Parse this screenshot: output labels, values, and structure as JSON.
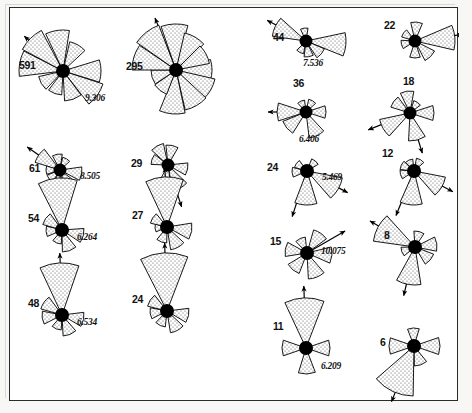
{
  "figure": {
    "title": "",
    "background": "#ffffff",
    "frame_color": "#2b2b2b",
    "petal_fill": "#ffffff",
    "petal_stipple": "#555555",
    "hub_color": "#000000"
  },
  "chart_data": {
    "type": "rose",
    "title": "",
    "xlabel": "",
    "ylabel": "",
    "note": "Sixteen circular (rose) diagrams of directional data; each shows petals radiating from a filled hub, a sample-count label, an optional mean vector magnitude value, and mean-direction arrows.",
    "columns": 4,
    "rows": 4,
    "roses": [
      {
        "id": "rose-591",
        "count": "591",
        "value": "9.306",
        "col": 1,
        "row": 1,
        "cx": 53,
        "cy": 63,
        "hub": 7.0,
        "petals": [
          {
            "mid": 0,
            "half": 17,
            "r": 38
          },
          {
            "mid": 35,
            "half": 17,
            "r": 42
          },
          {
            "mid": 70,
            "half": 17,
            "r": 30
          },
          {
            "mid": 110,
            "half": 17,
            "r": 24
          },
          {
            "mid": 150,
            "half": 17,
            "r": 25
          },
          {
            "mid": 190,
            "half": 17,
            "r": 44
          },
          {
            "mid": 225,
            "half": 17,
            "r": 46
          },
          {
            "mid": 262,
            "half": 17,
            "r": 41
          },
          {
            "mid": 300,
            "half": 17,
            "r": 30
          }
        ],
        "arrows": [
          {
            "dir": 222,
            "len": 52
          }
        ]
      },
      {
        "id": "rose-295",
        "count": "295",
        "value": "",
        "col": 2,
        "row": 1,
        "cx": 166,
        "cy": 62,
        "hub": 7.0,
        "petals": [
          {
            "mid": 0,
            "half": 17,
            "r": 36
          },
          {
            "mid": 30,
            "half": 17,
            "r": 40
          },
          {
            "mid": 60,
            "half": 17,
            "r": 41
          },
          {
            "mid": 95,
            "half": 17,
            "r": 44
          },
          {
            "mid": 128,
            "half": 17,
            "r": 26
          },
          {
            "mid": 163,
            "half": 17,
            "r": 25
          },
          {
            "mid": 197,
            "half": 17,
            "r": 44
          },
          {
            "mid": 232,
            "half": 17,
            "r": 48
          },
          {
            "mid": 268,
            "half": 17,
            "r": 46
          },
          {
            "mid": 300,
            "half": 17,
            "r": 38
          },
          {
            "mid": 332,
            "half": 17,
            "r": 34
          }
        ],
        "arrows": [
          {
            "dir": 248,
            "len": 56
          }
        ]
      },
      {
        "id": "rose-44",
        "count": "44",
        "value": "7.536",
        "col": 3,
        "row": 1,
        "cx": 296,
        "cy": 33,
        "hub": 6.5,
        "petals": [
          {
            "mid": 5,
            "half": 17,
            "r": 40
          },
          {
            "mid": 40,
            "half": 17,
            "r": 20
          },
          {
            "mid": 80,
            "half": 17,
            "r": 16
          },
          {
            "mid": 118,
            "half": 17,
            "r": 13
          },
          {
            "mid": 205,
            "half": 17,
            "r": 34
          },
          {
            "mid": 262,
            "half": 17,
            "r": 13
          }
        ],
        "arrows": [
          {
            "dir": 208,
            "len": 44
          }
        ]
      },
      {
        "id": "rose-22",
        "count": "22",
        "value": "",
        "col": 4,
        "row": 1,
        "cx": 405,
        "cy": 33,
        "hub": 6.5,
        "petals": [
          {
            "mid": 355,
            "half": 18,
            "r": 40
          },
          {
            "mid": 45,
            "half": 18,
            "r": 22
          },
          {
            "mid": 90,
            "half": 18,
            "r": 17
          },
          {
            "mid": 165,
            "half": 18,
            "r": 14
          },
          {
            "mid": 215,
            "half": 18,
            "r": 14
          },
          {
            "mid": 275,
            "half": 18,
            "r": 19
          }
        ],
        "arrows": [
          {
            "dir": 352,
            "len": 48
          }
        ]
      },
      {
        "id": "rose-61",
        "count": "61",
        "value": "8.505",
        "col": 1,
        "row": 2,
        "cx": 50,
        "cy": 162,
        "hub": 6.5,
        "petals": [
          {
            "mid": 10,
            "half": 18,
            "r": 22
          },
          {
            "mid": 55,
            "half": 18,
            "r": 21
          },
          {
            "mid": 98,
            "half": 18,
            "r": 22
          },
          {
            "mid": 140,
            "half": 18,
            "r": 14
          },
          {
            "mid": 180,
            "half": 18,
            "r": 14
          },
          {
            "mid": 215,
            "half": 18,
            "r": 26
          },
          {
            "mid": 260,
            "half": 18,
            "r": 16
          },
          {
            "mid": 300,
            "half": 18,
            "r": 13
          }
        ],
        "arrows": [
          {
            "dir": 215,
            "len": 40
          }
        ]
      },
      {
        "id": "rose-29",
        "count": "29",
        "value": "",
        "col": 2,
        "row": 2,
        "cx": 158,
        "cy": 157,
        "hub": 6.5,
        "petals": [
          {
            "mid": 12,
            "half": 18,
            "r": 20
          },
          {
            "mid": 62,
            "half": 18,
            "r": 26
          },
          {
            "mid": 100,
            "half": 18,
            "r": 24
          },
          {
            "mid": 200,
            "half": 18,
            "r": 17
          },
          {
            "mid": 240,
            "half": 18,
            "r": 22
          },
          {
            "mid": 282,
            "half": 18,
            "r": 20
          }
        ],
        "arrows": [
          {
            "dir": 72,
            "len": 44
          }
        ]
      },
      {
        "id": "rose-36",
        "count": "36",
        "value": "6.406",
        "col": 3,
        "row": 2,
        "cx": 296,
        "cy": 104,
        "hub": 6.5,
        "petals": [
          {
            "mid": 0,
            "half": 18,
            "r": 20
          },
          {
            "mid": 65,
            "half": 18,
            "r": 26
          },
          {
            "mid": 140,
            "half": 18,
            "r": 25
          },
          {
            "mid": 180,
            "half": 18,
            "r": 29
          },
          {
            "mid": 245,
            "half": 18,
            "r": 12
          },
          {
            "mid": 300,
            "half": 18,
            "r": 13
          }
        ],
        "arrows": [
          {
            "dir": 180,
            "len": 38
          }
        ]
      },
      {
        "id": "rose-18",
        "count": "18",
        "value": "",
        "col": 4,
        "row": 2,
        "cx": 400,
        "cy": 105,
        "hub": 6.5,
        "petals": [
          {
            "mid": 0,
            "half": 18,
            "r": 24
          },
          {
            "mid": 75,
            "half": 18,
            "r": 28
          },
          {
            "mid": 150,
            "half": 18,
            "r": 31
          },
          {
            "mid": 215,
            "half": 18,
            "r": 20
          },
          {
            "mid": 262,
            "half": 18,
            "r": 22
          },
          {
            "mid": 305,
            "half": 18,
            "r": 13
          }
        ],
        "arrows": [
          {
            "dir": 73,
            "len": 42
          },
          {
            "dir": 158,
            "len": 45
          }
        ]
      },
      {
        "id": "rose-54",
        "count": "54",
        "value": "6.264",
        "col": 1,
        "row": 3,
        "cx": 52,
        "cy": 222,
        "hub": 7.0,
        "petals": [
          {
            "mid": 15,
            "half": 19,
            "r": 22
          },
          {
            "mid": 70,
            "half": 19,
            "r": 22
          },
          {
            "mid": 112,
            "half": 19,
            "r": 14
          },
          {
            "mid": 175,
            "half": 19,
            "r": 16
          },
          {
            "mid": 215,
            "half": 19,
            "r": 20
          },
          {
            "mid": 265,
            "half": 22,
            "r": 52
          }
        ],
        "arrows": [
          {
            "dir": 268,
            "len": 62
          }
        ]
      },
      {
        "id": "rose-27",
        "count": "27",
        "value": "",
        "col": 2,
        "row": 3,
        "cx": 157,
        "cy": 219,
        "hub": 7.0,
        "petals": [
          {
            "mid": 10,
            "half": 19,
            "r": 25
          },
          {
            "mid": 62,
            "half": 19,
            "r": 23
          },
          {
            "mid": 110,
            "half": 19,
            "r": 16
          },
          {
            "mid": 175,
            "half": 19,
            "r": 12
          },
          {
            "mid": 212,
            "half": 19,
            "r": 17
          },
          {
            "mid": 267,
            "half": 22,
            "r": 50
          }
        ],
        "arrows": [
          {
            "dir": 268,
            "len": 60
          }
        ]
      },
      {
        "id": "rose-15",
        "count": "15",
        "value": "10.075",
        "col": 3,
        "row": 3,
        "cx": 297,
        "cy": 245,
        "hub": 7.0,
        "petals": [
          {
            "mid": 5,
            "half": 19,
            "r": 25
          },
          {
            "mid": 68,
            "half": 19,
            "r": 26
          },
          {
            "mid": 130,
            "half": 19,
            "r": 22
          },
          {
            "mid": 190,
            "half": 19,
            "r": 22
          },
          {
            "mid": 245,
            "half": 19,
            "r": 16
          },
          {
            "mid": 305,
            "half": 19,
            "r": 24
          }
        ],
        "arrows": [
          {
            "dir": 330,
            "len": 44
          }
        ]
      },
      {
        "id": "rose-8",
        "count": "8",
        "value": "",
        "col": 4,
        "row": 3,
        "cx": 405,
        "cy": 239,
        "hub": 7.0,
        "petals": [
          {
            "mid": 352,
            "half": 19,
            "r": 22
          },
          {
            "mid": 40,
            "half": 19,
            "r": 20
          },
          {
            "mid": 100,
            "half": 19,
            "r": 38
          },
          {
            "mid": 160,
            "half": 19,
            "r": 14
          },
          {
            "mid": 208,
            "half": 20,
            "r": 42
          },
          {
            "mid": 285,
            "half": 19,
            "r": 16
          }
        ],
        "arrows": [
          {
            "dir": 103,
            "len": 50
          },
          {
            "dir": 210,
            "len": 52
          }
        ]
      },
      {
        "id": "rose-48",
        "count": "48",
        "value": "6.534",
        "col": 1,
        "row": 4,
        "cx": 52,
        "cy": 307,
        "hub": 7.0,
        "petals": [
          {
            "mid": 12,
            "half": 19,
            "r": 22
          },
          {
            "mid": 68,
            "half": 19,
            "r": 21
          },
          {
            "mid": 112,
            "half": 19,
            "r": 15
          },
          {
            "mid": 172,
            "half": 19,
            "r": 20
          },
          {
            "mid": 215,
            "half": 19,
            "r": 22
          },
          {
            "mid": 267,
            "half": 22,
            "r": 52
          }
        ],
        "arrows": [
          {
            "dir": 268,
            "len": 62
          }
        ]
      },
      {
        "id": "rose-24b",
        "count": "24",
        "value": "",
        "col": 2,
        "row": 4,
        "cx": 157,
        "cy": 303,
        "hub": 7.0,
        "petals": [
          {
            "mid": 12,
            "half": 19,
            "r": 22
          },
          {
            "mid": 62,
            "half": 19,
            "r": 22
          },
          {
            "mid": 115,
            "half": 19,
            "r": 16
          },
          {
            "mid": 172,
            "half": 19,
            "r": 17
          },
          {
            "mid": 213,
            "half": 19,
            "r": 20
          },
          {
            "mid": 267,
            "half": 24,
            "r": 58
          }
        ],
        "arrows": [
          {
            "dir": 268,
            "len": 68
          }
        ]
      },
      {
        "id": "rose-24a",
        "count": "24",
        "value": "5.469",
        "col": 3,
        "row": 4,
        "cx": 297,
        "cy": 163,
        "hub": 7.0,
        "petals": [
          {
            "mid": 30,
            "half": 19,
            "r": 36
          },
          {
            "mid": 92,
            "half": 19,
            "r": 34
          },
          {
            "mid": 175,
            "half": 19,
            "r": 15
          },
          {
            "mid": 215,
            "half": 19,
            "r": 13
          },
          {
            "mid": 310,
            "half": 19,
            "r": 13
          }
        ],
        "arrows": [
          {
            "dir": 28,
            "len": 46
          },
          {
            "dir": 108,
            "len": 48
          }
        ]
      },
      {
        "id": "rose-12",
        "count": "12",
        "value": "",
        "col": 4,
        "row": 4,
        "cx": 404,
        "cy": 163,
        "hub": 7.0,
        "petals": [
          {
            "mid": 30,
            "half": 19,
            "r": 32
          },
          {
            "mid": 95,
            "half": 19,
            "r": 34
          },
          {
            "mid": 165,
            "half": 19,
            "r": 14
          },
          {
            "mid": 205,
            "half": 19,
            "r": 14
          },
          {
            "mid": 245,
            "half": 19,
            "r": 12
          },
          {
            "mid": 300,
            "half": 19,
            "r": 13
          }
        ],
        "arrows": [
          {
            "dir": 28,
            "len": 44
          },
          {
            "dir": 112,
            "len": 48
          }
        ]
      },
      {
        "id": "rose-11",
        "count": "11",
        "value": "6.209",
        "col": 3,
        "row": 5,
        "cx": 296,
        "cy": 340,
        "hub": 7.0,
        "petals": [
          {
            "mid": 0,
            "half": 19,
            "r": 24
          },
          {
            "mid": 88,
            "half": 19,
            "r": 26
          },
          {
            "mid": 180,
            "half": 19,
            "r": 24
          },
          {
            "mid": 268,
            "half": 23,
            "r": 50
          }
        ],
        "arrows": [
          {
            "dir": 268,
            "len": 62
          }
        ]
      },
      {
        "id": "rose-6",
        "count": "6",
        "value": "",
        "col": 4,
        "row": 5,
        "cx": 404,
        "cy": 338,
        "hub": 7.0,
        "petals": [
          {
            "mid": 0,
            "half": 19,
            "r": 26
          },
          {
            "mid": 70,
            "half": 19,
            "r": 20
          },
          {
            "mid": 115,
            "half": 24,
            "r": 50
          },
          {
            "mid": 180,
            "half": 19,
            "r": 25
          },
          {
            "mid": 268,
            "half": 19,
            "r": 18
          }
        ],
        "arrows": [
          {
            "dir": 112,
            "len": 60
          }
        ]
      }
    ]
  },
  "labels": {
    "count_offsets": {
      "rose-591": {
        "dx": -44,
        "dy": -12
      },
      "rose-295": {
        "dx": -50,
        "dy": -10
      },
      "rose-44": {
        "dx": -33,
        "dy": -10
      },
      "rose-22": {
        "dx": -31,
        "dy": -22
      },
      "rose-61": {
        "dx": -31,
        "dy": -8
      },
      "rose-29": {
        "dx": -37,
        "dy": -8
      },
      "rose-36": {
        "dx": -13,
        "dy": -35
      },
      "rose-18": {
        "dx": -7,
        "dy": -38
      },
      "rose-54": {
        "dx": -34,
        "dy": -18
      },
      "rose-27": {
        "dx": -35,
        "dy": -18
      },
      "rose-15": {
        "dx": -37,
        "dy": -18
      },
      "rose-8": {
        "dx": -31,
        "dy": -18
      },
      "rose-48": {
        "dx": -34,
        "dy": -18
      },
      "rose-24b": {
        "dx": -35,
        "dy": -18
      },
      "rose-24a": {
        "dx": -40,
        "dy": -10
      },
      "rose-12": {
        "dx": -32,
        "dy": -24
      },
      "rose-11": {
        "dx": -33,
        "dy": -28
      },
      "rose-6": {
        "dx": -34,
        "dy": -10
      }
    },
    "value_offsets": {
      "rose-591": {
        "dx": 22,
        "dy": 22
      },
      "rose-44": {
        "dx": -3,
        "dy": 17
      },
      "rose-61": {
        "dx": 20,
        "dy": 1
      },
      "rose-36": {
        "dx": -7,
        "dy": 22
      },
      "rose-54": {
        "dx": 15,
        "dy": 2
      },
      "rose-15": {
        "dx": 14,
        "dy": -7
      },
      "rose-48": {
        "dx": 15,
        "dy": 2
      },
      "rose-24a": {
        "dx": 15,
        "dy": 1
      },
      "rose-11": {
        "dx": 15,
        "dy": 13
      }
    }
  }
}
